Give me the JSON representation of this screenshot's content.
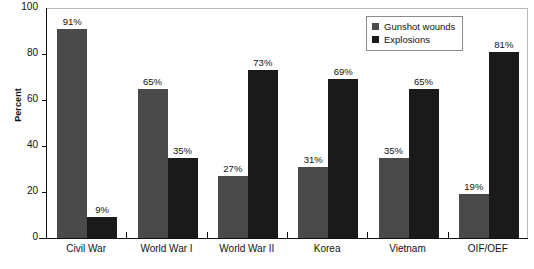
{
  "chart_data": {
    "type": "bar",
    "title": "",
    "xlabel": "",
    "ylabel": "Percent",
    "ylim": [
      0,
      100
    ],
    "yticks": [
      0,
      20,
      40,
      60,
      80,
      100
    ],
    "ytick_labels": [
      "0",
      "20",
      "40",
      "60",
      "80",
      "100"
    ],
    "grid": false,
    "legend_position": "top-right",
    "categories": [
      "Civil War",
      "World War I",
      "World War II",
      "Korea",
      "Vietnam",
      "OIF/OEF"
    ],
    "series": [
      {
        "name": "Gunshot wounds",
        "color": "#4a4a4a",
        "values": [
          91,
          65,
          27,
          31,
          35,
          19
        ],
        "value_labels": [
          "91%",
          "65%",
          "27%",
          "31%",
          "35%",
          "19%"
        ]
      },
      {
        "name": "Explosions",
        "color": "#1a1a1a",
        "values": [
          9,
          35,
          73,
          69,
          65,
          81
        ],
        "value_labels": [
          "9%",
          "35%",
          "73%",
          "69%",
          "65%",
          "81%"
        ]
      }
    ]
  },
  "legend": {
    "items": [
      {
        "label": "Gunshot wounds",
        "swatch": "gunshot"
      },
      {
        "label": "Explosions",
        "swatch": "explosion"
      }
    ]
  }
}
